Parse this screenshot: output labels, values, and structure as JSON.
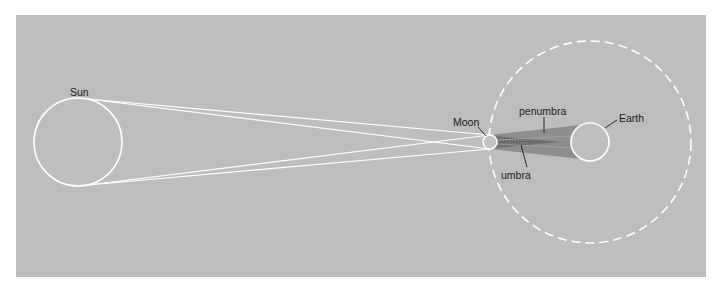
{
  "diagram": {
    "colors": {
      "panel_background": "#bdbdbd",
      "outline": "#ffffff",
      "penumbra": "#8c8c8c",
      "umbra": "#6a6a6a",
      "label_text": "#1a1a1a",
      "leader_line": "#1a1a1a"
    },
    "labels": {
      "sun": "Sun",
      "moon": "Moon",
      "earth": "Earth",
      "penumbra": "penumbra",
      "umbra": "umbra"
    },
    "bodies": [
      {
        "name": "Sun",
        "cx": 78,
        "cy": 142,
        "r": 44
      },
      {
        "name": "Moon",
        "cx": 490,
        "cy": 142,
        "r": 7
      },
      {
        "name": "Earth",
        "cx": 590,
        "cy": 142,
        "r": 19
      }
    ],
    "moon_orbit": {
      "cx": 590,
      "cy": 142,
      "r": 101,
      "style": "dashed"
    }
  }
}
